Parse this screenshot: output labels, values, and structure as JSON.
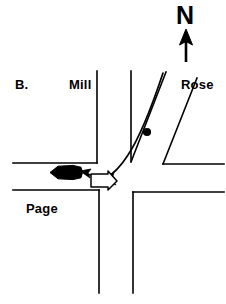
{
  "figure": {
    "panel_label": "B.",
    "type": "traffic-intersection-diagram",
    "background_color": "#ffffff",
    "stroke_color": "#000000",
    "width": 226,
    "height": 304
  },
  "compass": {
    "label": "N",
    "direction": "up",
    "arrow_name": "north-arrow"
  },
  "streets": [
    {
      "name": "Mill",
      "label": "Mill",
      "orientation": "vertical",
      "side": "upper-left"
    },
    {
      "name": "Rose",
      "label": "Rose",
      "orientation": "diagonal",
      "side": "upper-right"
    },
    {
      "name": "Page",
      "label": "Page",
      "orientation": "horizontal",
      "side": "lower-left"
    }
  ],
  "markers": {
    "reference_dot": {
      "name": "reference-dot",
      "x": 147,
      "y": 132,
      "radius": 4,
      "color": "#000000"
    }
  },
  "vehicles": [
    {
      "name": "filled-car-silhouette",
      "style": "solid-black",
      "heading": "west",
      "x": 50,
      "y": 166,
      "width": 33,
      "height": 13
    },
    {
      "name": "outline-arrow",
      "style": "white-outline",
      "heading": "east",
      "x": 91,
      "y": 174,
      "width": 26,
      "height": 14
    }
  ],
  "paths": [
    {
      "name": "curved-turn-path",
      "style": "solid",
      "description": "curve from Rose street turning left toward Page",
      "arrowhead": "west"
    },
    {
      "name": "dashed-connector-path",
      "style": "dash-dot",
      "description": "dashed arrow from outline arrow to filled car",
      "arrowhead": "west"
    }
  ],
  "colors": {
    "ink": "#000000",
    "paper": "#ffffff"
  }
}
